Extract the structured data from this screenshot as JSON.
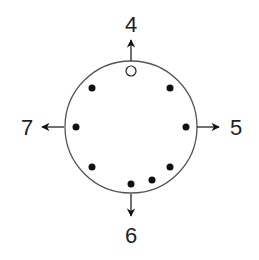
{
  "diagram": {
    "type": "circle-with-points-and-direction-arrows",
    "colors": {
      "stroke": "#555555",
      "dot": "#111111",
      "text": "#222222",
      "background": "#ffffff"
    },
    "circle": {
      "cx": 131,
      "cy": 127,
      "r": 66
    },
    "points": [
      {
        "name": "open-point-top",
        "x": 131,
        "y": 71,
        "filled": false
      },
      {
        "name": "point-top-left",
        "x": 92,
        "y": 88,
        "filled": true
      },
      {
        "name": "point-top-right",
        "x": 170,
        "y": 88,
        "filled": true
      },
      {
        "name": "point-left",
        "x": 76,
        "y": 127,
        "filled": true
      },
      {
        "name": "point-right",
        "x": 186,
        "y": 127,
        "filled": true
      },
      {
        "name": "point-bottom-left",
        "x": 92,
        "y": 167,
        "filled": true
      },
      {
        "name": "point-bottom-right",
        "x": 170,
        "y": 167,
        "filled": true
      },
      {
        "name": "point-bottom-center-right",
        "x": 152,
        "y": 180,
        "filled": true
      },
      {
        "name": "point-bottom-center",
        "x": 131,
        "y": 184,
        "filled": true
      }
    ],
    "arrows": [
      {
        "direction": "up",
        "label": "4"
      },
      {
        "direction": "right",
        "label": "5"
      },
      {
        "direction": "down",
        "label": "6"
      },
      {
        "direction": "left",
        "label": "7"
      }
    ]
  }
}
